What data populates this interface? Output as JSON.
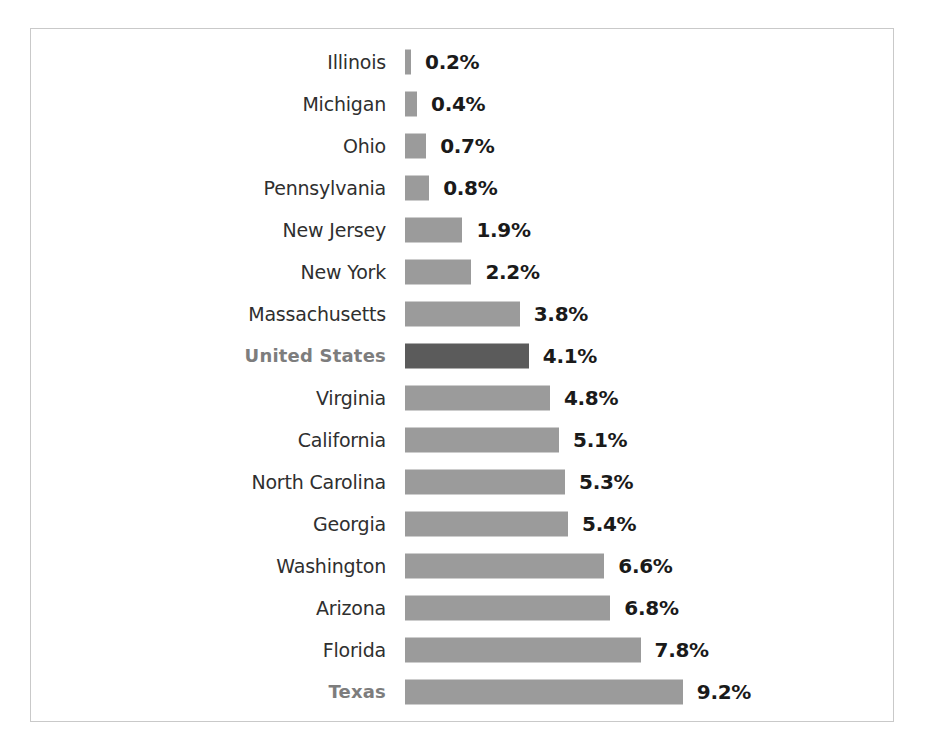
{
  "chart_data": {
    "type": "bar",
    "orientation": "horizontal",
    "title": "",
    "subtitle": "",
    "xlabel": "",
    "ylabel": "",
    "grid": false,
    "legend": "none",
    "axis_visible": false,
    "value_suffix": "%",
    "xlim": [
      0,
      9.2
    ],
    "max_value": 9.2,
    "colors": {
      "bar_default": "#9b9b9b",
      "bar_highlight": "#5b5b5b",
      "label_default": "#2f2f2f",
      "label_highlight": "#7d7d7d",
      "value_text": "#1a1a1a",
      "frame_border": "#c9c9c9",
      "background": "#ffffff"
    },
    "categories": [
      "Illinois",
      "Michigan",
      "Ohio",
      "Pennsylvania",
      "New Jersey",
      "New York",
      "Massachusetts",
      "United States",
      "Virginia",
      "California",
      "North Carolina",
      "Georgia",
      "Washington",
      "Arizona",
      "Florida",
      "Texas"
    ],
    "values": [
      0.2,
      0.4,
      0.7,
      0.8,
      1.9,
      2.2,
      3.8,
      4.1,
      4.8,
      5.1,
      5.3,
      5.4,
      6.6,
      6.8,
      7.8,
      9.2
    ],
    "value_labels": [
      "0.2%",
      "0.4%",
      "0.7%",
      "0.8%",
      "1.9%",
      "2.2%",
      "3.8%",
      "4.1%",
      "4.8%",
      "5.1%",
      "5.3%",
      "5.4%",
      "6.6%",
      "6.8%",
      "7.8%",
      "9.2%"
    ],
    "highlighted": [
      "United States",
      "Texas"
    ],
    "rows": [
      {
        "label": "Illinois",
        "value": 0.2,
        "value_label": "0.2%",
        "emphasis": "none"
      },
      {
        "label": "Michigan",
        "value": 0.4,
        "value_label": "0.4%",
        "emphasis": "none"
      },
      {
        "label": "Ohio",
        "value": 0.7,
        "value_label": "0.7%",
        "emphasis": "none"
      },
      {
        "label": "Pennsylvania",
        "value": 0.8,
        "value_label": "0.8%",
        "emphasis": "none"
      },
      {
        "label": "New Jersey",
        "value": 1.9,
        "value_label": "1.9%",
        "emphasis": "none"
      },
      {
        "label": "New York",
        "value": 2.2,
        "value_label": "2.2%",
        "emphasis": "none"
      },
      {
        "label": "Massachusetts",
        "value": 3.8,
        "value_label": "3.8%",
        "emphasis": "none"
      },
      {
        "label": "United States",
        "value": 4.1,
        "value_label": "4.1%",
        "emphasis": "bar-and-label"
      },
      {
        "label": "Virginia",
        "value": 4.8,
        "value_label": "4.8%",
        "emphasis": "none"
      },
      {
        "label": "California",
        "value": 5.1,
        "value_label": "5.1%",
        "emphasis": "none"
      },
      {
        "label": "North Carolina",
        "value": 5.3,
        "value_label": "5.3%",
        "emphasis": "none"
      },
      {
        "label": "Georgia",
        "value": 5.4,
        "value_label": "5.4%",
        "emphasis": "none"
      },
      {
        "label": "Washington",
        "value": 6.6,
        "value_label": "6.6%",
        "emphasis": "none"
      },
      {
        "label": "Arizona",
        "value": 6.8,
        "value_label": "6.8%",
        "emphasis": "none"
      },
      {
        "label": "Florida",
        "value": 7.8,
        "value_label": "7.8%",
        "emphasis": "none"
      },
      {
        "label": "Texas",
        "value": 9.2,
        "value_label": "9.2%",
        "emphasis": "label"
      }
    ]
  }
}
